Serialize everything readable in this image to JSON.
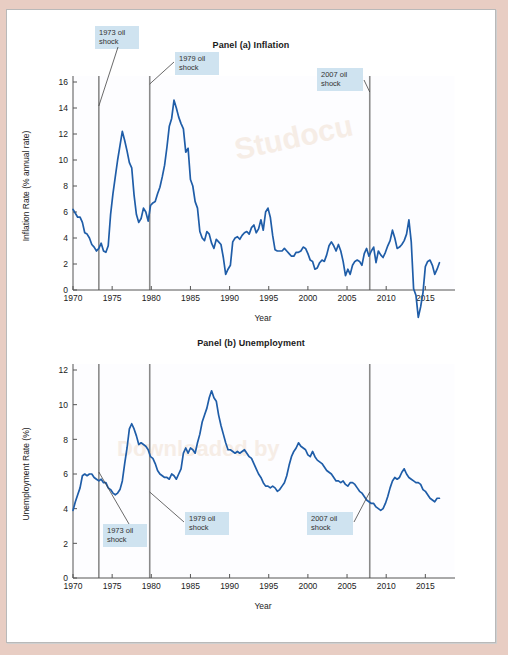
{
  "figure": {
    "background_color": "#e8cdc3",
    "frame_color": "#ffffff",
    "series_color": "#1f5da8",
    "shock_line_color": "#8a8a8a",
    "annotation_bg": "#cfe3f0"
  },
  "chart_data": [
    {
      "type": "line",
      "title": "Panel (a) Inflation",
      "xlabel": "Year",
      "ylabel": "Inflation Rate (% annual rate)",
      "xlim": [
        1970,
        2017
      ],
      "ylim": [
        0,
        16
      ],
      "yticks": [
        0,
        2,
        4,
        6,
        8,
        10,
        12,
        14,
        16
      ],
      "xticks": [
        1970,
        1975,
        1980,
        1985,
        1990,
        1995,
        2000,
        2005,
        2010,
        2015
      ],
      "grid": false,
      "legend": "none",
      "annotations": [
        {
          "label": "1973 oil\nshock",
          "year": 1973.3
        },
        {
          "label": "1979 oil\nshock",
          "year": 1979.8
        },
        {
          "label": "2007 oil\nshock",
          "year": 2007.9
        }
      ],
      "vlines": [
        1973.3,
        1979.8,
        2007.9
      ],
      "series": [
        {
          "name": "Inflation Rate",
          "x": [
            1970.0,
            1970.3,
            1970.6,
            1970.9,
            1971.2,
            1971.5,
            1971.8,
            1972.1,
            1972.4,
            1972.7,
            1973.0,
            1973.3,
            1973.6,
            1973.9,
            1974.2,
            1974.5,
            1974.8,
            1975.1,
            1975.4,
            1975.7,
            1976.0,
            1976.3,
            1976.6,
            1976.9,
            1977.2,
            1977.5,
            1977.8,
            1978.1,
            1978.4,
            1978.7,
            1979.0,
            1979.3,
            1979.6,
            1979.9,
            1980.2,
            1980.5,
            1980.8,
            1981.1,
            1981.4,
            1981.7,
            1982.0,
            1982.3,
            1982.6,
            1982.9,
            1983.2,
            1983.5,
            1983.8,
            1984.1,
            1984.4,
            1984.7,
            1985.0,
            1985.3,
            1985.6,
            1985.9,
            1986.2,
            1986.5,
            1986.8,
            1987.1,
            1987.4,
            1987.7,
            1988.0,
            1988.3,
            1988.6,
            1988.9,
            1989.2,
            1989.5,
            1989.8,
            1990.1,
            1990.4,
            1990.7,
            1991.0,
            1991.3,
            1991.6,
            1991.9,
            1992.2,
            1992.5,
            1992.8,
            1993.1,
            1993.4,
            1993.7,
            1994.0,
            1994.3,
            1994.6,
            1994.9,
            1995.2,
            1995.5,
            1995.8,
            1996.1,
            1996.4,
            1996.7,
            1997.0,
            1997.3,
            1997.6,
            1997.9,
            1998.2,
            1998.5,
            1998.8,
            1999.1,
            1999.4,
            1999.7,
            2000.0,
            2000.3,
            2000.6,
            2000.9,
            2001.2,
            2001.5,
            2001.8,
            2002.1,
            2002.4,
            2002.7,
            2003.0,
            2003.3,
            2003.6,
            2003.9,
            2004.2,
            2004.5,
            2004.8,
            2005.1,
            2005.4,
            2005.7,
            2006.0,
            2006.3,
            2006.6,
            2006.9,
            2007.2,
            2007.5,
            2007.8,
            2008.1,
            2008.4,
            2008.7,
            2009.0,
            2009.3,
            2009.6,
            2009.9,
            2010.2,
            2010.5,
            2010.8,
            2011.1,
            2011.4,
            2011.7,
            2012.0,
            2012.3,
            2012.6,
            2012.9,
            2013.2,
            2013.5,
            2013.8,
            2014.1,
            2014.4,
            2014.7,
            2015.0,
            2015.3,
            2015.6,
            2015.9,
            2016.2,
            2016.5,
            2016.8
          ],
          "y": [
            6.2,
            5.9,
            5.6,
            5.6,
            5.2,
            4.4,
            4.3,
            4.0,
            3.5,
            3.3,
            3.0,
            3.2,
            3.6,
            3.0,
            2.9,
            3.4,
            5.8,
            7.4,
            8.7,
            10.0,
            11.1,
            12.2,
            11.5,
            10.7,
            9.8,
            9.4,
            7.3,
            5.8,
            5.2,
            5.5,
            6.3,
            6.0,
            5.3,
            6.5,
            6.7,
            6.8,
            7.4,
            7.9,
            8.7,
            9.6,
            11.0,
            12.6,
            13.2,
            14.6,
            14.0,
            13.3,
            12.8,
            12.4,
            10.6,
            10.9,
            8.5,
            8.0,
            6.8,
            6.3,
            4.5,
            4.0,
            3.8,
            4.5,
            4.3,
            3.6,
            3.2,
            3.9,
            3.7,
            3.5,
            2.5,
            1.2,
            1.6,
            1.9,
            3.7,
            4.0,
            4.1,
            3.9,
            4.2,
            4.4,
            4.5,
            4.3,
            4.8,
            5.0,
            4.4,
            4.7,
            5.4,
            4.6,
            6.0,
            6.3,
            5.6,
            4.2,
            3.1,
            3.0,
            3.0,
            3.0,
            3.2,
            3.0,
            2.8,
            2.6,
            2.6,
            2.9,
            2.9,
            3.0,
            3.3,
            3.2,
            2.8,
            2.3,
            2.2,
            1.6,
            1.7,
            2.1,
            2.3,
            2.2,
            2.7,
            3.4,
            3.7,
            3.4,
            3.0,
            3.5,
            3.0,
            2.2,
            1.1,
            1.6,
            1.2,
            1.9,
            2.2,
            2.3,
            2.2,
            1.9,
            2.8,
            3.2,
            2.6,
            3.0,
            3.3,
            2.1,
            3.0,
            2.7,
            2.5,
            2.9,
            3.4,
            3.8,
            4.6,
            4.0,
            3.2,
            3.3,
            3.5,
            3.8,
            4.3,
            5.4,
            3.7,
            0.1,
            -0.4,
            -2.1,
            -1.3,
            -0.2,
            1.8,
            2.2,
            2.3,
            1.9,
            1.2,
            1.6,
            2.1,
            2.7,
            3.2,
            3.6,
            3.8,
            3.0,
            2.7,
            2.3,
            1.9,
            1.7,
            2.0,
            1.7,
            1.5,
            1.8,
            1.6,
            1.2,
            1.5,
            1.3,
            1.5,
            1.1,
            0.8,
            0.2,
            -0.1,
            0.0,
            0.1,
            0.7,
            1.0,
            1.4,
            1.6,
            1.7,
            2.1,
            2.6,
            1.8
          ]
        }
      ]
    },
    {
      "type": "line",
      "title": "Panel (b) Unemployment",
      "xlabel": "Year",
      "ylabel": "Unemployment Rate (%)",
      "xlim": [
        1970,
        2017
      ],
      "ylim": [
        0,
        12
      ],
      "yticks": [
        0,
        2,
        4,
        6,
        8,
        10,
        12
      ],
      "xticks": [
        1970,
        1975,
        1980,
        1985,
        1990,
        1995,
        2000,
        2005,
        2010,
        2015
      ],
      "grid": false,
      "legend": "none",
      "annotations": [
        {
          "label": "1973 oil\nshock",
          "year": 1973.3
        },
        {
          "label": "1979 oil\nshock",
          "year": 1979.8
        },
        {
          "label": "2007 oil\nshock",
          "year": 2007.9
        }
      ],
      "vlines": [
        1973.3,
        1979.8,
        2007.9
      ],
      "series": [
        {
          "name": "Unemployment Rate",
          "x": [
            1970.0,
            1970.3,
            1970.6,
            1970.9,
            1971.2,
            1971.5,
            1971.8,
            1972.1,
            1972.4,
            1972.7,
            1973.0,
            1973.3,
            1973.6,
            1973.9,
            1974.2,
            1974.5,
            1974.8,
            1975.1,
            1975.4,
            1975.7,
            1976.0,
            1976.3,
            1976.6,
            1976.9,
            1977.2,
            1977.5,
            1977.8,
            1978.1,
            1978.4,
            1978.7,
            1979.0,
            1979.3,
            1979.6,
            1979.9,
            1980.2,
            1980.5,
            1980.8,
            1981.1,
            1981.4,
            1981.7,
            1982.0,
            1982.3,
            1982.6,
            1982.9,
            1983.2,
            1983.5,
            1983.8,
            1984.1,
            1984.4,
            1984.7,
            1985.0,
            1985.3,
            1985.6,
            1985.9,
            1986.2,
            1986.5,
            1986.8,
            1987.1,
            1987.4,
            1987.7,
            1988.0,
            1988.3,
            1988.6,
            1988.9,
            1989.2,
            1989.5,
            1989.8,
            1990.1,
            1990.4,
            1990.7,
            1991.0,
            1991.3,
            1991.6,
            1991.9,
            1992.2,
            1992.5,
            1992.8,
            1993.1,
            1993.4,
            1993.7,
            1994.0,
            1994.3,
            1994.6,
            1994.9,
            1995.2,
            1995.5,
            1995.8,
            1996.1,
            1996.4,
            1996.7,
            1997.0,
            1997.3,
            1997.6,
            1997.9,
            1998.2,
            1998.5,
            1998.8,
            1999.1,
            1999.4,
            1999.7,
            2000.0,
            2000.3,
            2000.6,
            2000.9,
            2001.2,
            2001.5,
            2001.8,
            2002.1,
            2002.4,
            2002.7,
            2003.0,
            2003.3,
            2003.6,
            2003.9,
            2004.2,
            2004.5,
            2004.8,
            2005.1,
            2005.4,
            2005.7,
            2006.0,
            2006.3,
            2006.6,
            2006.9,
            2007.2,
            2007.5,
            2007.8,
            2008.1,
            2008.4,
            2008.7,
            2009.0,
            2009.3,
            2009.6,
            2009.9,
            2010.2,
            2010.5,
            2010.8,
            2011.1,
            2011.4,
            2011.7,
            2012.0,
            2012.3,
            2012.6,
            2012.9,
            2013.2,
            2013.5,
            2013.8,
            2014.1,
            2014.4,
            2014.7,
            2015.0,
            2015.3,
            2015.6,
            2015.9,
            2016.2,
            2016.5,
            2016.8
          ],
          "y": [
            3.9,
            4.4,
            4.8,
            5.2,
            5.9,
            6.0,
            5.9,
            6.0,
            6.0,
            5.8,
            5.7,
            5.6,
            5.7,
            5.5,
            5.5,
            5.2,
            5.1,
            4.9,
            4.8,
            4.9,
            5.1,
            5.6,
            6.6,
            7.5,
            8.6,
            8.9,
            8.6,
            8.2,
            7.7,
            7.8,
            7.7,
            7.6,
            7.4,
            7.0,
            6.9,
            6.6,
            6.2,
            6.0,
            5.9,
            5.8,
            5.8,
            5.7,
            6.0,
            5.9,
            5.7,
            6.0,
            6.3,
            7.2,
            7.5,
            7.2,
            7.5,
            7.4,
            7.2,
            7.8,
            8.3,
            9.0,
            9.4,
            9.8,
            10.4,
            10.8,
            10.4,
            10.2,
            9.4,
            8.8,
            8.3,
            7.8,
            7.4,
            7.4,
            7.3,
            7.2,
            7.3,
            7.2,
            7.3,
            7.4,
            7.2,
            7.0,
            6.9,
            6.6,
            6.3,
            6.0,
            5.8,
            5.5,
            5.3,
            5.3,
            5.2,
            5.3,
            5.2,
            5.0,
            5.1,
            5.3,
            5.5,
            5.9,
            6.5,
            7.0,
            7.3,
            7.5,
            7.8,
            7.6,
            7.5,
            7.4,
            7.1,
            7.0,
            7.3,
            7.0,
            6.8,
            6.7,
            6.6,
            6.4,
            6.2,
            6.1,
            6.0,
            5.8,
            5.6,
            5.6,
            5.5,
            5.6,
            5.4,
            5.3,
            5.5,
            5.5,
            5.4,
            5.2,
            5.0,
            4.9,
            4.7,
            4.5,
            4.4,
            4.3,
            4.3,
            4.1,
            4.0,
            3.9,
            4.0,
            4.3,
            4.7,
            5.2,
            5.6,
            5.8,
            5.7,
            5.8,
            6.1,
            6.3,
            6.0,
            5.8,
            5.7,
            5.6,
            5.5,
            5.5,
            5.4,
            5.1,
            5.0,
            4.8,
            4.6,
            4.5,
            4.4,
            4.6,
            4.6,
            4.5,
            4.6,
            5.2,
            6.6,
            7.8,
            8.8,
            9.5,
            10.0,
            9.8,
            9.7,
            9.4,
            9.6,
            9.5,
            9.5,
            9.4,
            9.1,
            9.0,
            8.9,
            8.6,
            8.3,
            8.2,
            8.1,
            7.9,
            7.8,
            7.5,
            7.3,
            7.0,
            6.6,
            6.2,
            6.0,
            5.7,
            5.5,
            5.4,
            5.2,
            5.0,
            4.9,
            4.9,
            4.8,
            4.6,
            4.4,
            4.3
          ]
        }
      ]
    }
  ]
}
